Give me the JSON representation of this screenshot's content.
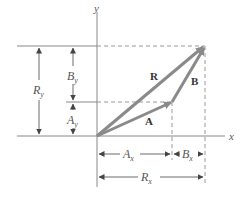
{
  "diagram": {
    "axes": {
      "x_label": "x",
      "y_label": "y"
    },
    "vectors": [
      {
        "name": "A",
        "label": "A"
      },
      {
        "name": "B",
        "label": "B"
      },
      {
        "name": "R",
        "label": "R"
      }
    ],
    "components": {
      "Ax": {
        "base": "A",
        "sub": "x"
      },
      "Bx": {
        "base": "B",
        "sub": "x"
      },
      "Rx": {
        "base": "R",
        "sub": "x"
      },
      "Ay": {
        "base": "A",
        "sub": "y"
      },
      "By": {
        "base": "B",
        "sub": "y"
      },
      "Ry": {
        "base": "R",
        "sub": "y"
      }
    },
    "colors": {
      "vector": "#8a8a8a",
      "line": "#888888",
      "text": "#555555"
    }
  }
}
